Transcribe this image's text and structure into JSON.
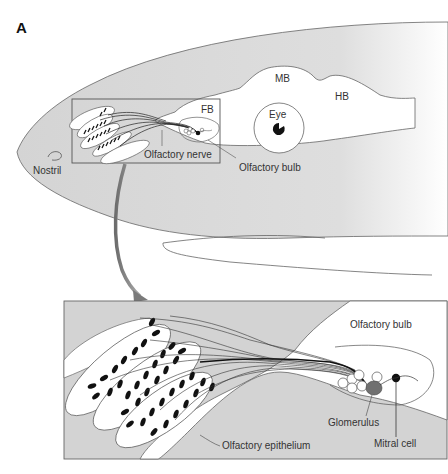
{
  "figure": {
    "panel_label": "A",
    "top_view": {
      "regions": {
        "midbrain": "MB",
        "hindbrain": "HB",
        "forebrain": "FB",
        "eye": "Eye"
      },
      "labels": {
        "nostril": "Nostril",
        "olfactory_nerve": "Olfactory nerve",
        "olfactory_bulb": "Olfactory bulb"
      }
    },
    "inset_view": {
      "labels": {
        "olfactory_bulb": "Olfactory bulb",
        "glomerulus": "Glomerulus",
        "mitral_cell": "Mitral cell",
        "olfactory_epithelium": "Olfactory epithelium"
      }
    },
    "colors": {
      "tissue_fill": "#d6d6d6",
      "brain_fill": "#ffffff",
      "outline": "#555555",
      "arrow": "#8a8a8a",
      "glomerulus": "#707070",
      "mitral_cell": "#111111"
    }
  }
}
